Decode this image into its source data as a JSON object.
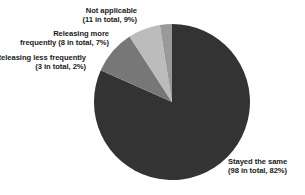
{
  "chart_data": {
    "type": "pie",
    "title": "",
    "subtitle": "",
    "xlabel": "",
    "ylabel": "",
    "total": 120,
    "legend_position": "none",
    "labels_position": "outside",
    "grid": false,
    "categories": [
      "Stayed the same",
      "Not applicable",
      "Releasing more frequently",
      "Releasing less frequently"
    ],
    "values": [
      98,
      11,
      8,
      3
    ],
    "percentages": [
      82,
      9,
      7,
      2
    ],
    "colors": [
      "#333333",
      "#777777",
      "#bcbcbc",
      "#999999"
    ],
    "slices": [
      {
        "name": "Stayed the same",
        "count": 98,
        "percent": 82,
        "color": "#333333",
        "label_line1": "Stayed the same",
        "label_line2": "(98 in total, 82%)"
      },
      {
        "name": "Not applicable",
        "count": 11,
        "percent": 9,
        "color": "#777777",
        "label_line1": "Not applicable",
        "label_line2": "(11 in total, 9%)"
      },
      {
        "name": "Releasing more frequently",
        "count": 8,
        "percent": 7,
        "color": "#bcbcbc",
        "label_line1": "Releasing more",
        "label_line2": "frequently (8 in total, 7%)"
      },
      {
        "name": "Releasing less frequently",
        "count": 3,
        "percent": 2,
        "color": "#999999",
        "label_line1": "Releasing less frequently",
        "label_line2": "(3 in total, 2%)"
      }
    ]
  },
  "geometry": {
    "center_x": 172,
    "center_y": 102,
    "radius": 78
  },
  "background_color": "#ffffff",
  "text_color": "#1a1a1a"
}
